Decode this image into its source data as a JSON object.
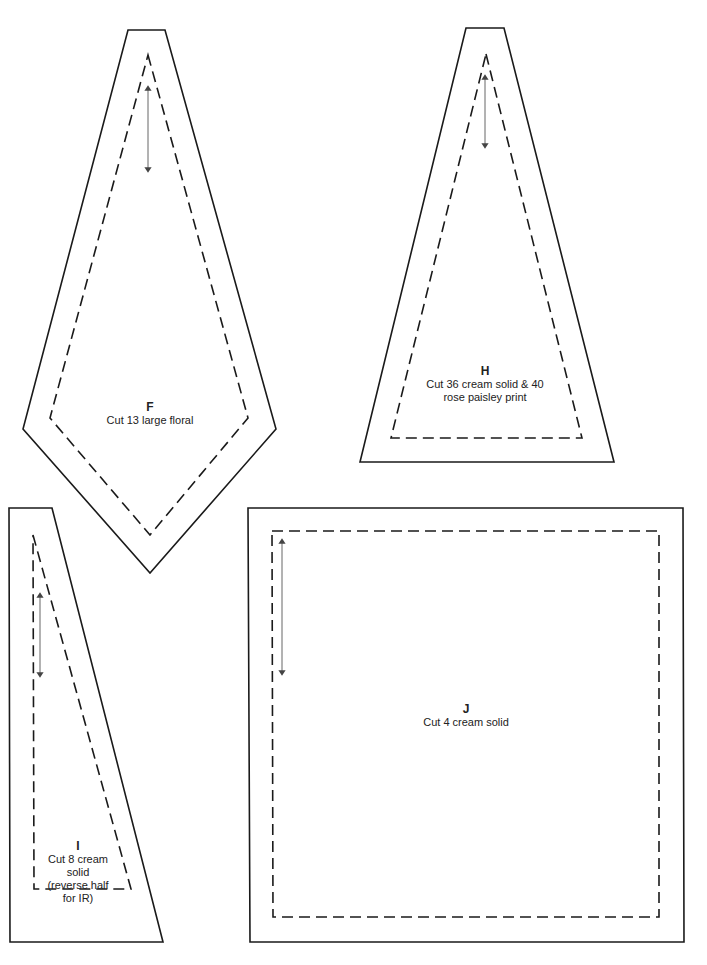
{
  "pieces": [
    {
      "id": "F",
      "letter": "F",
      "instruction": "Cut 13 large floral"
    },
    {
      "id": "H",
      "letter": "H",
      "instruction_line1": "Cut 36 cream solid & 40",
      "instruction_line2": "rose paisley print"
    },
    {
      "id": "I",
      "letter": "I",
      "instruction_line1": "Cut 8 cream",
      "instruction_line2": "solid",
      "instruction_line3": "(reverse half",
      "instruction_line4": "for IR)"
    },
    {
      "id": "J",
      "letter": "J",
      "instruction": "Cut 4 cream solid"
    }
  ],
  "legend": {
    "outer_line": "cutting line (solid)",
    "inner_line": "seam line (dashed)",
    "arrow": "grain line"
  },
  "colors": {
    "line": "#1a1a1a",
    "background": "#ffffff"
  }
}
